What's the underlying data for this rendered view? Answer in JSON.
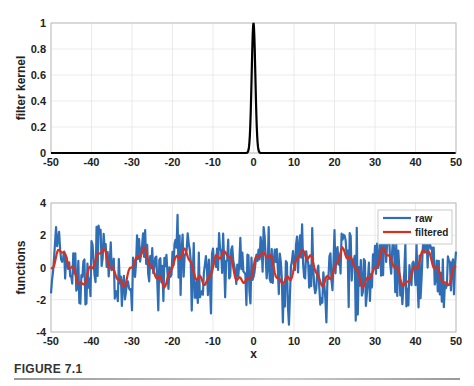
{
  "caption": "FIGURE 7.1",
  "chart_data": [
    {
      "type": "line",
      "title": "",
      "xlabel": "",
      "ylabel": "filter kernel",
      "xlim": [
        -50,
        50
      ],
      "ylim": [
        0,
        1
      ],
      "xticks": [
        -50,
        -40,
        -30,
        -20,
        -10,
        0,
        10,
        20,
        30,
        40,
        50
      ],
      "yticks": [
        0,
        0.2,
        0.4,
        0.6,
        0.8,
        1
      ],
      "ytick_labels": [
        "0",
        "0.2",
        "0.4",
        "0.6",
        "0.8",
        "1"
      ],
      "grid": true,
      "series": [
        {
          "name": "filter kernel",
          "color": "#000000",
          "x": [
            -50,
            -2,
            -1.5,
            -1,
            -0.5,
            0,
            0.5,
            1,
            1.5,
            2,
            50
          ],
          "values": [
            0,
            0,
            0.01,
            0.08,
            0.5,
            1.0,
            0.5,
            0.08,
            0.01,
            0,
            0
          ]
        }
      ]
    },
    {
      "type": "line",
      "title": "",
      "xlabel": "x",
      "ylabel": "functions",
      "xlim": [
        -50,
        50
      ],
      "ylim": [
        -4,
        4
      ],
      "xticks": [
        -50,
        -40,
        -30,
        -20,
        -10,
        0,
        10,
        20,
        30,
        40,
        50
      ],
      "yticks": [
        -4,
        -2,
        0,
        2,
        4
      ],
      "grid": true,
      "legend": {
        "position": "upper right",
        "entries": [
          "raw",
          "filtered"
        ]
      },
      "series": [
        {
          "name": "raw",
          "color": "#2f6db5",
          "description": "sine (period ~10, amplitude ~1) plus strong high-frequency noise; range approx -4 to 3.5",
          "period": 10,
          "amplitude": 1,
          "noise_range": [
            -3.9,
            3.4
          ]
        },
        {
          "name": "filtered",
          "color": "#d9301e",
          "description": "smoothed signal following sine of period ~10, range approx -1.4 to 1.3",
          "period": 10,
          "amplitude": 1,
          "range": [
            -1.4,
            1.3
          ]
        }
      ]
    }
  ]
}
